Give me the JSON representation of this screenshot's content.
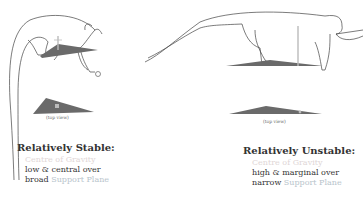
{
  "colors": {
    "outline": "#444444",
    "support_plane": "#6a6a6a",
    "cog_marker": "#bbbbbb",
    "centre_of_gravity_text": "#e0d6d6",
    "support_plane_text": "#b8c4cc"
  },
  "stable": {
    "top_view_caption": "(top view)",
    "heading": "Relatively Stable:",
    "line1": "Centre of Gravity",
    "line2": "low & central over",
    "line3_prefix": "broad ",
    "line3_suffix": "Support Plane"
  },
  "unstable": {
    "top_view_caption": "(top view)",
    "heading": "Relatively Unstable:",
    "line1": "Centre of Gravity",
    "line2": "high & marginal over",
    "line3_prefix": "narrow ",
    "line3_suffix": "Support Plane"
  }
}
